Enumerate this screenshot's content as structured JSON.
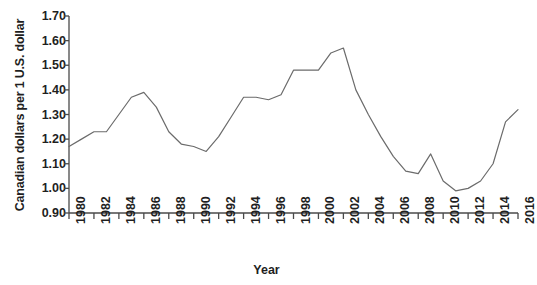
{
  "chart_data": {
    "type": "line",
    "title": "",
    "xlabel": "Year",
    "ylabel": "Canadian dollars per 1 U.S. dollar",
    "xlim": [
      1980,
      2016
    ],
    "ylim": [
      0.9,
      1.7
    ],
    "ytick_step": 0.1,
    "xtick_step": 2,
    "grid": false,
    "legend": null,
    "line_color": "#6b6b6b",
    "axis_color": "#4a4a4a",
    "background_color": "#ffffff",
    "x_tick_labels": [
      "1980",
      "1982",
      "1984",
      "1986",
      "1988",
      "1990",
      "1992",
      "1994",
      "1996",
      "1998",
      "2000",
      "2002",
      "2004",
      "2006",
      "2008",
      "2010",
      "2012",
      "2014",
      "2016"
    ],
    "y_tick_labels": [
      "0.90",
      "1.00",
      "1.10",
      "1.20",
      "1.30",
      "1.40",
      "1.50",
      "1.60",
      "1.70"
    ],
    "x": [
      1980,
      1981,
      1982,
      1983,
      1984,
      1985,
      1986,
      1987,
      1988,
      1989,
      1990,
      1991,
      1992,
      1993,
      1994,
      1995,
      1996,
      1997,
      1998,
      1999,
      2000,
      2001,
      2002,
      2003,
      2004,
      2005,
      2006,
      2007,
      2008,
      2009,
      2010,
      2011,
      2012,
      2013,
      2014,
      2015,
      2016
    ],
    "values": [
      1.17,
      1.2,
      1.23,
      1.23,
      1.3,
      1.37,
      1.39,
      1.33,
      1.23,
      1.18,
      1.17,
      1.15,
      1.21,
      1.29,
      1.37,
      1.37,
      1.36,
      1.38,
      1.48,
      1.48,
      1.48,
      1.55,
      1.57,
      1.4,
      1.3,
      1.21,
      1.13,
      1.07,
      1.06,
      1.14,
      1.03,
      0.99,
      1.0,
      1.03,
      1.1,
      1.27,
      1.32
    ],
    "series_name": "Canadian dollars per 1 U.S. dollar"
  },
  "axis": {
    "x_title": "Year",
    "y_title": "Canadian dollars per 1 U.S. dollar"
  }
}
